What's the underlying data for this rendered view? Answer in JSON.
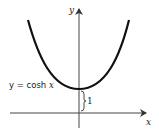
{
  "diagram": {
    "axes": {
      "x_label": "x",
      "y_label": "y"
    },
    "curve": {
      "label_prefix": "y = cosh ",
      "label_var": "x",
      "function": "cosh x",
      "color": "#111111"
    },
    "annotation": {
      "brace_label": "1",
      "meaning": "height of minimum above x-axis"
    }
  }
}
